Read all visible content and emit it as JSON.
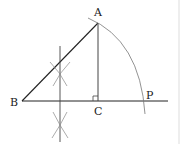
{
  "diagram": {
    "type": "geometric-construction",
    "points": {
      "A": {
        "label": "A",
        "x": 98,
        "y": 23
      },
      "B": {
        "label": "B",
        "x": 22,
        "y": 101
      },
      "C": {
        "label": "C",
        "x": 98,
        "y": 101
      },
      "P": {
        "label": "P",
        "x": 146,
        "y": 101
      }
    },
    "segments": [
      "AB",
      "AC",
      "B-baseline"
    ],
    "right_angle_at": "C",
    "colors": {
      "stroke": "#222222",
      "arc": "#777777"
    }
  }
}
